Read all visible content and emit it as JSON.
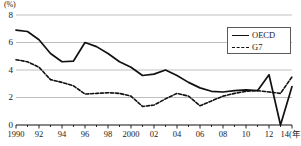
{
  "chart_data": {
    "type": "line",
    "title": "",
    "subtitle": "",
    "xlabel": "",
    "ylabel": "",
    "unit_label": "(%)",
    "x_axis_suffix": "14(年)",
    "grid": true,
    "legend_position": "top-right",
    "xlim": [
      1990,
      2014
    ],
    "ylim": [
      0,
      8
    ],
    "y_ticks": [
      0,
      2,
      4,
      6,
      8
    ],
    "y_tick_labels": [
      "0",
      "2",
      "4",
      "6",
      "8"
    ],
    "x": [
      1990,
      1991,
      1992,
      1993,
      1994,
      1995,
      1996,
      1997,
      1998,
      1999,
      2000,
      2001,
      2002,
      2003,
      2004,
      2005,
      2006,
      2007,
      2008,
      2009,
      2010,
      2011,
      2012,
      2013,
      2014
    ],
    "x_tick_values": [
      1990,
      1992,
      1994,
      1996,
      1998,
      2000,
      2002,
      2004,
      2006,
      2008,
      2010,
      2012,
      2014
    ],
    "x_tick_labels": [
      "1990",
      "92",
      "94",
      "96",
      "98",
      "2000",
      "02",
      "04",
      "06",
      "08",
      "10",
      "12",
      "14(年)"
    ],
    "series": [
      {
        "name": "OECD",
        "style": "solid",
        "color": "#111111",
        "values": [
          6.9,
          6.8,
          6.2,
          5.2,
          4.6,
          4.65,
          6.0,
          5.7,
          5.2,
          4.6,
          4.2,
          3.6,
          3.7,
          4.0,
          3.6,
          3.1,
          2.7,
          2.45,
          2.4,
          2.5,
          2.55,
          2.5,
          3.65,
          0.0,
          2.8
        ],
        "values_note": "Values read from gridlines; 2013 dip to 0, recovery after"
      },
      {
        "name": "G7",
        "style": "dashed",
        "color": "#111111",
        "values": [
          4.75,
          4.6,
          4.2,
          3.3,
          3.1,
          2.85,
          2.25,
          2.3,
          2.35,
          2.3,
          2.1,
          1.35,
          1.45,
          1.9,
          2.3,
          2.1,
          1.4,
          1.75,
          2.1,
          2.3,
          2.45,
          2.5,
          2.4,
          2.3,
          3.5
        ]
      }
    ],
    "series_points": {
      "OECD": [
        {
          "x": 1990,
          "y": 6.9
        },
        {
          "x": 1991,
          "y": 6.8
        },
        {
          "x": 1992,
          "y": 6.2
        },
        {
          "x": 1993,
          "y": 5.2
        },
        {
          "x": 1994,
          "y": 4.6
        },
        {
          "x": 1995,
          "y": 4.65
        },
        {
          "x": 1996,
          "y": 6.0
        },
        {
          "x": 1997,
          "y": 5.7
        },
        {
          "x": 1998,
          "y": 5.2
        },
        {
          "x": 1999,
          "y": 4.6
        },
        {
          "x": 2000,
          "y": 4.2
        },
        {
          "x": 2001,
          "y": 3.6
        },
        {
          "x": 2002,
          "y": 3.7
        },
        {
          "x": 2003,
          "y": 4.0
        },
        {
          "x": 2004,
          "y": 3.6
        },
        {
          "x": 2005,
          "y": 3.1
        },
        {
          "x": 2006,
          "y": 2.7
        },
        {
          "x": 2007,
          "y": 2.45
        },
        {
          "x": 2008,
          "y": 2.4
        },
        {
          "x": 2009,
          "y": 2.5
        },
        {
          "x": 2010,
          "y": 2.55
        },
        {
          "x": 2011,
          "y": 2.5
        },
        {
          "x": 2012,
          "y": 3.65
        },
        {
          "x": 2013,
          "y": 0.0
        },
        {
          "x": 2014,
          "y": 2.8
        }
      ],
      "G7": [
        {
          "x": 1990,
          "y": 4.75
        },
        {
          "x": 1991,
          "y": 4.6
        },
        {
          "x": 1992,
          "y": 4.2
        },
        {
          "x": 1993,
          "y": 3.3
        },
        {
          "x": 1994,
          "y": 3.1
        },
        {
          "x": 1995,
          "y": 2.85
        },
        {
          "x": 1996,
          "y": 2.25
        },
        {
          "x": 1997,
          "y": 2.3
        },
        {
          "x": 1998,
          "y": 2.35
        },
        {
          "x": 1999,
          "y": 2.3
        },
        {
          "x": 2000,
          "y": 2.1
        },
        {
          "x": 2001,
          "y": 1.35
        },
        {
          "x": 2002,
          "y": 1.45
        },
        {
          "x": 2003,
          "y": 1.9
        },
        {
          "x": 2004,
          "y": 2.3
        },
        {
          "x": 2005,
          "y": 2.1
        },
        {
          "x": 2006,
          "y": 1.4
        },
        {
          "x": 2007,
          "y": 1.75
        },
        {
          "x": 2008,
          "y": 2.1
        },
        {
          "x": 2009,
          "y": 2.3
        },
        {
          "x": 2010,
          "y": 2.45
        },
        {
          "x": 2011,
          "y": 2.5
        },
        {
          "x": 2012,
          "y": 2.4
        },
        {
          "x": 2013,
          "y": 2.3
        },
        {
          "x": 2014,
          "y": 3.5
        }
      ]
    },
    "legend": [
      {
        "label": "OECD",
        "style": "solid"
      },
      {
        "label": "G7",
        "style": "dashed"
      }
    ],
    "colors": {
      "line": "#111111",
      "grid": "#b8b8b8",
      "axis": "#111111",
      "legend_border": "#5a5a5a",
      "background": "#ffffff"
    }
  },
  "geometry": {
    "plot_left": 16,
    "plot_right": 292,
    "plot_top": 15,
    "plot_bottom": 125
  }
}
